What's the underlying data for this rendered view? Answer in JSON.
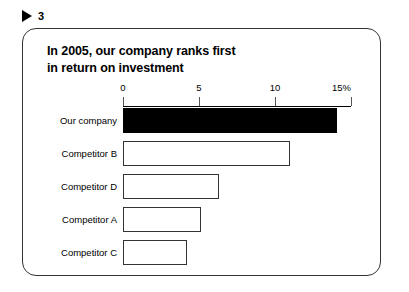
{
  "slide": {
    "marker_icon": "triangle-right-icon",
    "number": "3"
  },
  "chart_data": {
    "type": "bar",
    "orientation": "horizontal",
    "title": "In 2005, our company ranks first\nin return on investment",
    "xlabel": "",
    "ylabel": "",
    "xlim": [
      0,
      15
    ],
    "grid": false,
    "legend": false,
    "unit": "%",
    "tick_labels": [
      "0",
      "5",
      "10",
      "15%"
    ],
    "tick_values": [
      0,
      5,
      10,
      15
    ],
    "categories": [
      "Our company",
      "Competitor B",
      "Competitor D",
      "Competitor A",
      "Competitor C"
    ],
    "values": [
      14.1,
      11.0,
      6.3,
      5.1,
      4.2
    ],
    "highlight_index": 0,
    "colors": {
      "highlight_fill": "#000000",
      "bar_fill": "#ffffff",
      "bar_stroke": "#333333",
      "axis": "#000000",
      "text": "#000000",
      "frame": "#333333",
      "background": "#ffffff"
    }
  }
}
